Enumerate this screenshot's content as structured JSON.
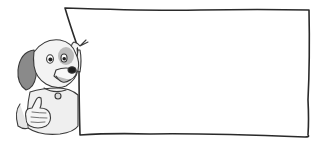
{
  "scene": {
    "description": "Cartoon dog giving thumbs up while holding a blank sign",
    "sign": {
      "text": "",
      "fill": "#ffffff",
      "stroke": "#2a2a2a"
    },
    "dog": {
      "pose": "thumbs-up",
      "palette": {
        "fur": "#f2f2f2",
        "shade": "#cfcfcf",
        "ear": "#8a8a8a",
        "outline": "#3a3a3a",
        "nose": "#1e1e1e"
      }
    }
  }
}
